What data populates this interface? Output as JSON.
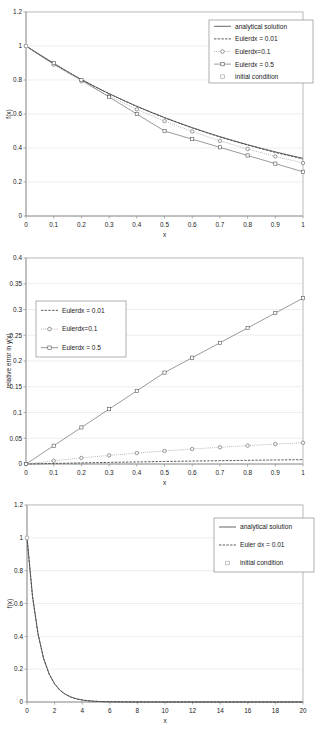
{
  "figure": {
    "background": "#ffffff",
    "grid_color": "#e3e3e3",
    "axis_color": "#8c8c8c",
    "series_color": "#4a4a4a"
  },
  "chart_data": [
    {
      "id": "chart-1",
      "type": "line",
      "title": "",
      "xlabel": "x",
      "ylabel": "f(x)",
      "xlim": [
        0,
        1
      ],
      "ylim": [
        0,
        1.2
      ],
      "xticks": [
        "0",
        "0.1",
        "0.2",
        "0.3",
        "0.4",
        "0.5",
        "0.6",
        "0.7",
        "0.8",
        "0.9",
        "1"
      ],
      "yticks": [
        "0",
        "0.2",
        "0.4",
        "0.6",
        "0.8",
        "1",
        "1.2"
      ],
      "grid": "horizontal",
      "legend_position": "top-right",
      "legend": [
        {
          "label": "analytical solution",
          "marker": "line-solid"
        },
        {
          "label": "Eulerdx = 0.01",
          "marker": "line-dashed"
        },
        {
          "label": "Eulerdx=0.1",
          "marker": "line-open-circle"
        },
        {
          "label": "Eulerdx = 0.5",
          "marker": "line-open-square"
        },
        {
          "label": "initial condition",
          "marker": "point-open-square"
        }
      ],
      "series": [
        {
          "name": "analytical solution",
          "style": "solid",
          "x": [
            0,
            0.05,
            0.1,
            0.15,
            0.2,
            0.25,
            0.3,
            0.35,
            0.4,
            0.45,
            0.5,
            0.55,
            0.6,
            0.65,
            0.7,
            0.75,
            0.8,
            0.85,
            0.9,
            0.95,
            1.0
          ],
          "y": [
            1.0,
            0.9464,
            0.8958,
            0.848,
            0.8027,
            0.76,
            0.7197,
            0.6815,
            0.6454,
            0.6113,
            0.5791,
            0.5486,
            0.5199,
            0.4927,
            0.4669,
            0.4426,
            0.4196,
            0.3979,
            0.3773,
            0.3578,
            0.3393
          ]
        },
        {
          "name": "Eulerdx = 0.01",
          "style": "dashed",
          "x": [
            0,
            0.1,
            0.2,
            0.3,
            0.4,
            0.5,
            0.6,
            0.7,
            0.8,
            0.9,
            1.0
          ],
          "y": [
            1.0,
            0.8953,
            0.802,
            0.7188,
            0.6443,
            0.5777,
            0.518,
            0.4646,
            0.4168,
            0.3739,
            0.3355
          ]
        },
        {
          "name": "Eulerdx=0.1",
          "style": "dotted-marker",
          "marker": "circle",
          "x": [
            0,
            0.1,
            0.2,
            0.3,
            0.4,
            0.5,
            0.6,
            0.7,
            0.8,
            0.9,
            1.0
          ],
          "y": [
            1.0,
            0.89,
            0.792,
            0.7049,
            0.6274,
            0.5584,
            0.497,
            0.4423,
            0.3937,
            0.3504,
            0.3118
          ]
        },
        {
          "name": "Eulerdx = 0.5",
          "style": "solid-marker",
          "marker": "square",
          "x": [
            0,
            0.1,
            0.2,
            0.3,
            0.4,
            0.5,
            0.6,
            0.7,
            0.8,
            0.9,
            1.0
          ],
          "y": [
            1.0,
            0.9,
            0.8,
            0.7,
            0.6,
            0.5,
            0.452,
            0.404,
            0.356,
            0.308,
            0.26
          ]
        },
        {
          "name": "initial condition",
          "style": "marker-only",
          "marker": "square",
          "x": [
            0
          ],
          "y": [
            1.0
          ]
        }
      ],
      "annotations": []
    },
    {
      "id": "chart-2",
      "type": "line",
      "title": "",
      "xlabel": "x",
      "ylabel": "relative error in y(x)",
      "xlim": [
        0,
        1
      ],
      "ylim": [
        0,
        0.4
      ],
      "xticks": [
        "0",
        "0.1",
        "0.2",
        "0.3",
        "0.4",
        "0.5",
        "0.6",
        "0.7",
        "0.8",
        "0.9",
        "1"
      ],
      "yticks": [
        "0",
        "0.05",
        "0.1",
        "0.15",
        "0.2",
        "0.25",
        "0.3",
        "0.35",
        "0.4"
      ],
      "grid": "horizontal",
      "legend_position": "left",
      "legend": [
        {
          "label": "Eulerdx = 0.01",
          "marker": "line-dashed"
        },
        {
          "label": "Eulerdx=0.1",
          "marker": "line-open-circle"
        },
        {
          "label": "Eulerdx = 0.5",
          "marker": "line-open-square"
        }
      ],
      "series": [
        {
          "name": "Eulerdx = 0.01",
          "style": "dashed",
          "x": [
            0,
            0.1,
            0.2,
            0.3,
            0.4,
            0.5,
            0.6,
            0.7,
            0.8,
            0.9,
            1.0
          ],
          "y": [
            0,
            0.0011,
            0.0021,
            0.0031,
            0.004,
            0.0049,
            0.0057,
            0.0064,
            0.0071,
            0.0078,
            0.0084
          ]
        },
        {
          "name": "Eulerdx=0.1",
          "style": "dotted-marker",
          "marker": "circle",
          "x": [
            0,
            0.1,
            0.2,
            0.3,
            0.4,
            0.5,
            0.6,
            0.7,
            0.8,
            0.9,
            1.0
          ],
          "y": [
            0,
            0.0063,
            0.0118,
            0.0167,
            0.0212,
            0.0253,
            0.0291,
            0.0325,
            0.0357,
            0.0386,
            0.0413
          ]
        },
        {
          "name": "Eulerdx = 0.5",
          "style": "solid-marker",
          "marker": "square",
          "x": [
            0,
            0.1,
            0.2,
            0.3,
            0.4,
            0.5,
            0.6,
            0.7,
            0.8,
            0.9,
            1.0
          ],
          "y": [
            0,
            0.0355,
            0.071,
            0.1065,
            0.142,
            0.1775,
            0.2064,
            0.2353,
            0.2642,
            0.2931,
            0.322
          ]
        }
      ],
      "annotations": []
    },
    {
      "id": "chart-3",
      "type": "line",
      "title": "",
      "xlabel": "x",
      "ylabel": "f(x)",
      "xlim": [
        0,
        20
      ],
      "ylim": [
        0,
        1.2
      ],
      "xticks": [
        "0",
        "2",
        "4",
        "6",
        "8",
        "10",
        "12",
        "14",
        "16",
        "18",
        "20"
      ],
      "yticks": [
        "0",
        "0.2",
        "0.4",
        "0.6",
        "0.8",
        "1",
        "1.2"
      ],
      "grid": "horizontal",
      "legend_position": "top-right",
      "legend": [
        {
          "label": "analytical solution",
          "marker": "line-solid"
        },
        {
          "label": "Euler dx = 0.01",
          "marker": "line-dashed"
        },
        {
          "label": "initial condition",
          "marker": "point-open-square"
        }
      ],
      "series": [
        {
          "name": "analytical solution",
          "style": "solid",
          "decay": 1.1,
          "x": [
            0,
            0.4,
            0.8,
            1.2,
            1.6,
            2.0,
            2.4,
            2.8,
            3.2,
            3.6,
            4.0,
            4.4,
            4.8,
            5.2,
            5.6,
            6.0,
            7.0,
            8.0,
            9.0,
            10.0,
            12.0,
            14.0,
            16.0,
            18.0,
            20.0
          ],
          "y": [
            1.0,
            0.644,
            0.4148,
            0.2671,
            0.172,
            0.1108,
            0.0714,
            0.046,
            0.0296,
            0.0191,
            0.0123,
            0.0079,
            0.0051,
            0.0033,
            0.0021,
            0.0014,
            0.0004,
            0.0002,
            0.0001,
            0.0,
            0.0,
            0.0,
            0.0,
            0.0,
            0.0
          ]
        },
        {
          "name": "Euler dx = 0.01",
          "style": "dashed",
          "decay": 1.1,
          "x": [
            0,
            0.4,
            0.8,
            1.2,
            1.6,
            2.0,
            2.4,
            2.8,
            3.2,
            3.6,
            4.0,
            4.4,
            4.8,
            5.2,
            5.6,
            6.0,
            7.0,
            8.0,
            9.0,
            10.0,
            12.0,
            14.0,
            16.0,
            18.0,
            20.0
          ],
          "y": [
            1.0,
            0.642,
            0.4122,
            0.2647,
            0.17,
            0.1092,
            0.0701,
            0.045,
            0.0289,
            0.0186,
            0.0119,
            0.0077,
            0.0049,
            0.0032,
            0.002,
            0.0013,
            0.0004,
            0.0001,
            0.0001,
            0.0,
            0.0,
            0.0,
            0.0,
            0.0,
            0.0
          ]
        },
        {
          "name": "initial condition",
          "style": "marker-only",
          "marker": "square",
          "x": [
            0
          ],
          "y": [
            1.0
          ]
        }
      ],
      "annotations": []
    }
  ]
}
